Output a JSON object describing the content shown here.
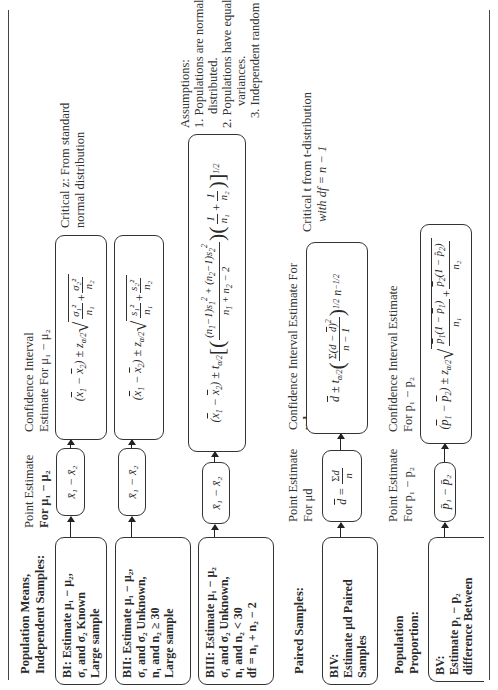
{
  "sections": [
    {
      "id": "independent",
      "header": [
        "Population Means,",
        "Independent Samples:"
      ]
    },
    {
      "id": "paired",
      "header": [
        "Paired Samples:"
      ]
    },
    {
      "id": "proportion",
      "header": [
        "Population",
        "Proportion:"
      ]
    }
  ],
  "column_labels": {
    "means_point": [
      "Point Estimate",
      "For μ₁ − μ₂"
    ],
    "means_ci": [
      "Confidence Interval",
      "Estimate For μ₁ − μ₂"
    ],
    "paired_point": [
      "Point Estimate",
      "For μd"
    ],
    "paired_ci": [
      "Confidence Interval Estimate For",
      "μd"
    ],
    "prop_point": [
      "Point Estimate",
      "For p₁ − p₂"
    ],
    "prop_ci": [
      "Confidence Interval Estimate",
      "For p₁ − p₂"
    ]
  },
  "cases": {
    "BI": {
      "lines": [
        "BI: Estimate μ₁ − μ₂,",
        "σ₁ and σ₂ Known",
        "Large sample"
      ],
      "point_estimate": "x̄₁ − x̄₂",
      "ci_formula": "(x̄₁ − x̄₂) ± z_{α/2} √(σ₁²/n₁ + σ₂²/n₂)",
      "note": [
        "Critical z: From standard",
        "normal distribution"
      ]
    },
    "BII": {
      "lines": [
        "BII: Estimate μ₁ − μ₂,",
        "σ₁ and σ₂ Unknown,",
        "n₁ and n₂ ≥ 30",
        "Large sample"
      ],
      "point_estimate": "x̄₁ − x̄₂",
      "ci_formula": "(x̄₁ − x̄₂) ± z_{α/2} √(s₁²/n₁ + s₂²/n₂)"
    },
    "BIII": {
      "lines": [
        "BIII: Estimate μ₁ − μ₂",
        "σ₁ and σ₂ Unknown,",
        "n₁ and n₂ < 30",
        "df = n₁ + n₂ − 2"
      ],
      "point_estimate": "x̄₁ − x̄₂",
      "ci_formula": "(x̄₁ − x̄₂) ± t_{α/2} [ ((n₁−1)s₁² + (n₂−1)s₂²)/(n₁+n₂−2) · (1/n₁ + 1/n₂) ]^{1/2}",
      "assumptions": {
        "title": "Assumptions:",
        "items": [
          "1. Populations are normally",
          "distributed.",
          "2. Populations have equal",
          "variances.",
          "3. Independent random samples"
        ]
      }
    },
    "BIV": {
      "lines": [
        "BIV:",
        "Estimate μd Paired",
        "Samples"
      ],
      "point_estimate": "d̄ = Σd / n",
      "ci_formula": "d̄ ± t_{α/2} ( Σ(d − d̄)² / (n − 1) )^{1/2} n^{−1/2}",
      "note": [
        "Critical t from t-distribution",
        "with df = n − 1"
      ]
    },
    "BV": {
      "lines": [
        "BV:",
        "Estimate p₁ − p₂",
        "difference Between"
      ],
      "point_estimate": "p̄₁ − p̄₂",
      "ci_formula": "(p̄₁ − p̄₂) ± z_{α/2} √( p̄₁(1 − p̄₁)/n₁ + p̄₂(1 − p̂₂)/n₂ )"
    }
  },
  "glyphs": {
    "xbar1": "x̄₁",
    "xbar2": "x̄₂",
    "minus": "−",
    "pm": "±",
    "sqrt": "√",
    "z": "z",
    "t": "t",
    "alpha2": "α/2",
    "plus": "+",
    "sigma1sq": "σ₁²",
    "sigma2sq": "σ₂²",
    "s1sq": "s₁²",
    "s2sq": "s₂²",
    "n1": "n₁",
    "n2": "n₂",
    "one": "1",
    "dbar": "d̄",
    "sum": "Σ",
    "d": "d",
    "n": "n",
    "nminus1": "n − 1",
    "eq": "=",
    "pbar1": "p̄₁",
    "pbar2": "p̄₂",
    "phat2": "p̂₂",
    "half": "1/2",
    "neghalf": "−1/2"
  }
}
